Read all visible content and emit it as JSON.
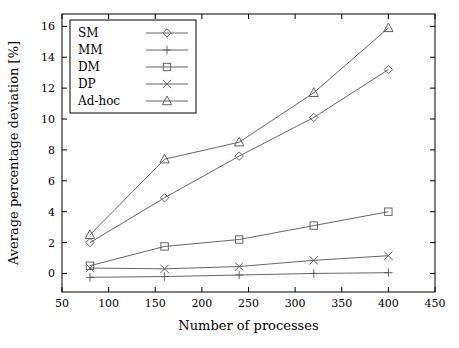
{
  "chart_data": {
    "type": "line",
    "title": "",
    "xlabel": "Number of processes",
    "ylabel": "Average percentage deviation [%]",
    "xlim": [
      50,
      450
    ],
    "ylim": [
      -1.2,
      16.8
    ],
    "xticks": [
      "50",
      "100",
      "150",
      "200",
      "250",
      "300",
      "350",
      "400",
      "450"
    ],
    "yticks": [
      "0",
      "2",
      "4",
      "6",
      "8",
      "10",
      "12",
      "14",
      "16"
    ],
    "grid": false,
    "legend_position": "top-left",
    "x": [
      80,
      160,
      240,
      320,
      400
    ],
    "series": [
      {
        "name": "SM",
        "marker": "diamond",
        "values": [
          2.0,
          4.9,
          7.6,
          10.1,
          13.2
        ]
      },
      {
        "name": "MM",
        "marker": "plus",
        "values": [
          -0.25,
          -0.2,
          -0.1,
          0.0,
          0.05
        ]
      },
      {
        "name": "DM",
        "marker": "square",
        "values": [
          0.5,
          1.75,
          2.2,
          3.1,
          4.0
        ]
      },
      {
        "name": "DP",
        "marker": "cross",
        "values": [
          0.35,
          0.3,
          0.45,
          0.85,
          1.15
        ]
      },
      {
        "name": "Ad-hoc",
        "marker": "triangle",
        "values": [
          2.5,
          7.4,
          8.5,
          11.7,
          15.9
        ]
      }
    ]
  },
  "colors": {
    "axis": "#000000",
    "series": "#555555",
    "background": "#ffffff"
  }
}
